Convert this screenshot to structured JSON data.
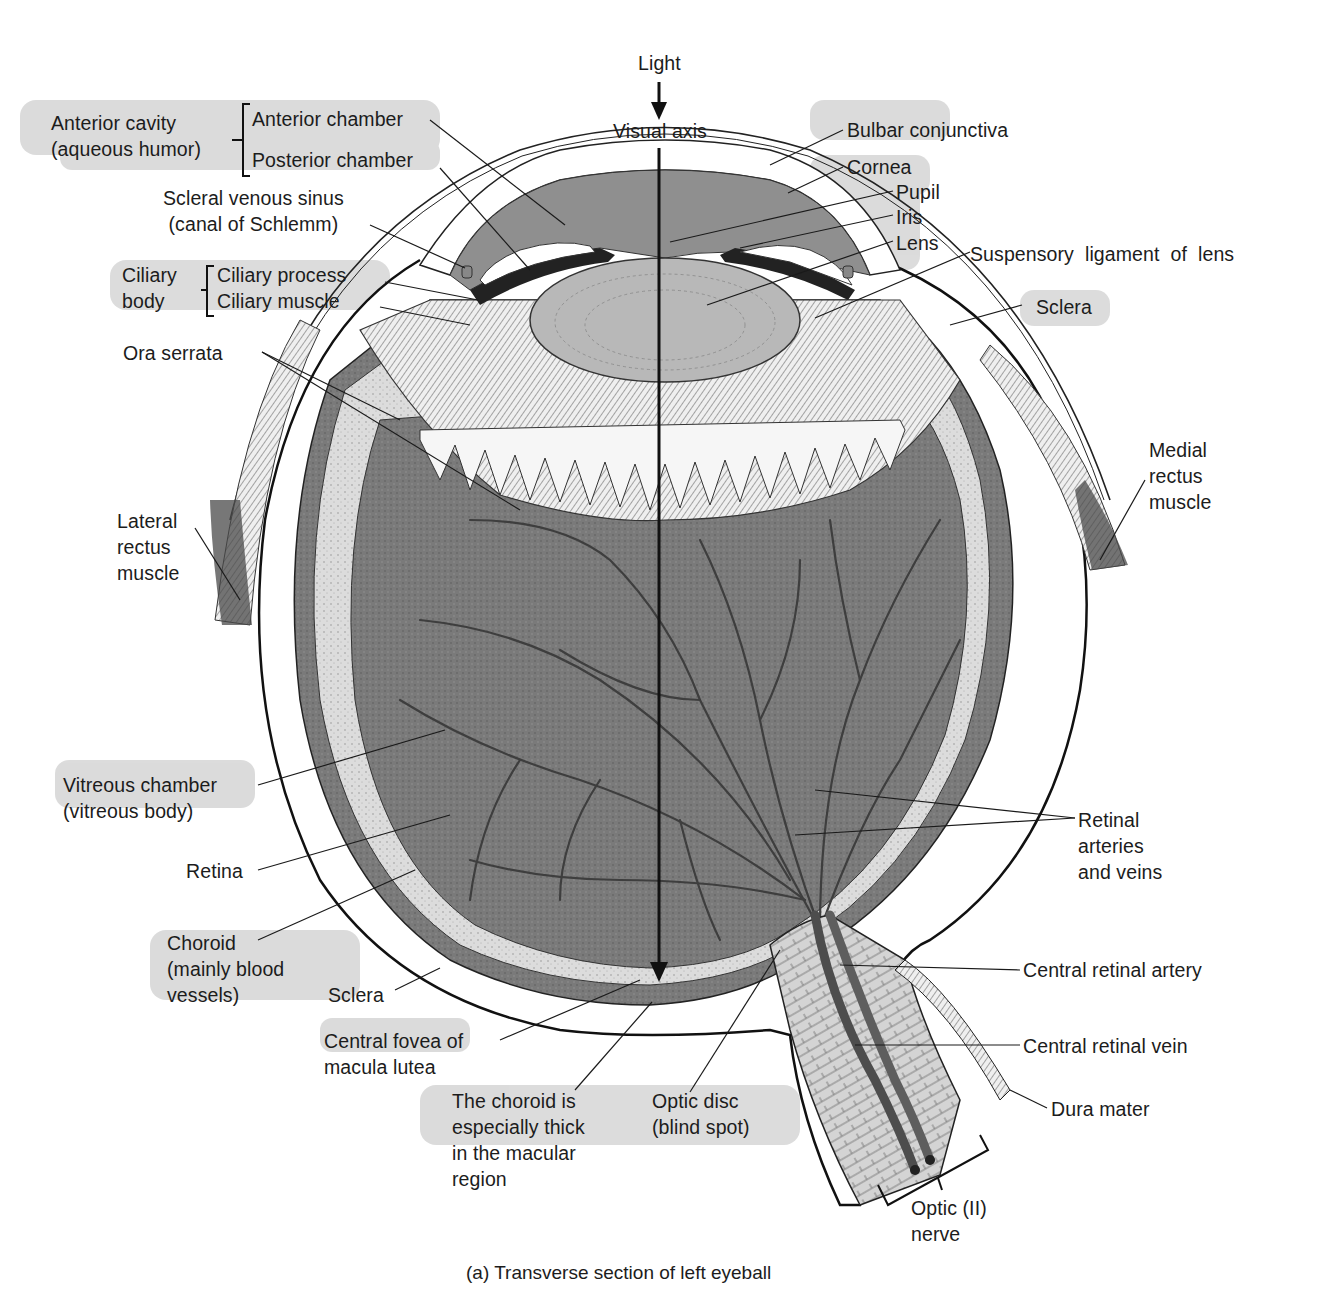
{
  "figure": {
    "caption": "(a)  Transverse section of left eyeball",
    "colors": {
      "background": "#ffffff",
      "aqueous": "#8f8f8f",
      "lens": "#b8b8b8",
      "vitreous": "#7d7d7d",
      "retina_band": "#d9d9d9",
      "choroid": "#5a5a5a",
      "sclera": "#ffffff",
      "vessel": "#4d4d4d",
      "label_highlight": "#c8c8c8",
      "ink": "#111111"
    }
  },
  "labels": {
    "light": "Light",
    "visual_axis": "Visual axis",
    "anterior_cavity": "Anterior cavity\n(aqueous humor)",
    "anterior_chamber": "Anterior chamber",
    "posterior_chamber": "Posterior chamber",
    "scleral_venous_sinus": "Scleral venous sinus\n(canal of Schlemm)",
    "ciliary_body": "Ciliary\nbody",
    "ciliary_process": "Ciliary process",
    "ciliary_muscle": "Ciliary muscle",
    "ora_serrata": "Ora serrata",
    "lateral_rectus": "Lateral\nrectus\nmuscle",
    "vitreous_chamber": "Vitreous chamber\n(vitreous body)",
    "retina": "Retina",
    "choroid": "Choroid\n(mainly blood\nvessels)",
    "sclera_left": "Sclera",
    "central_fovea": "Central fovea of\nmacula lutea",
    "choroid_thick": "The choroid is\nespecially thick\nin the macular\nregion",
    "optic_disc": "Optic disc\n(blind spot)",
    "optic_nerve": "Optic (II)\nnerve",
    "dura_mater": "Dura mater",
    "central_retinal_vein": "Central retinal vein",
    "central_retinal_artery": "Central retinal artery",
    "retinal_vessels": "Retinal\narteries\nand veins",
    "medial_rectus": "Medial\nrectus\nmuscle",
    "sclera_right": "Sclera",
    "suspensory_ligament": "Suspensory  ligament  of  lens",
    "lens": "Lens",
    "iris": "Iris",
    "pupil": "Pupil",
    "cornea": "Cornea",
    "bulbar_conjunctiva": "Bulbar conjunctiva"
  }
}
